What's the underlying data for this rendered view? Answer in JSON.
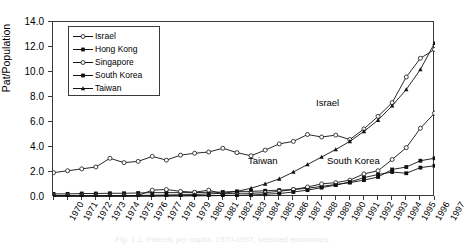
{
  "figure": {
    "caption": "Fig. 1.1. Patents per capita, 1970-1997, selected economies"
  },
  "axes": {
    "ylabel": "Pat/Population",
    "yticks": [
      "0.0",
      "2.0",
      "4.0",
      "6.0",
      "8.0",
      "10.0",
      "12.0",
      "14.0"
    ],
    "xticks": [
      "1970",
      "1971",
      "1972",
      "1973",
      "1974",
      "1975",
      "1976",
      "1977",
      "1978",
      "1979",
      "1980",
      "1981",
      "1982",
      "1983",
      "1984",
      "1985",
      "1986",
      "1987",
      "1988",
      "1989",
      "1990",
      "1991",
      "1992",
      "1993",
      "1994",
      "1995",
      "1996",
      "1997"
    ]
  },
  "legend": {
    "items": [
      {
        "label": "Israel",
        "marker": "open-circle",
        "color": "#111111"
      },
      {
        "label": "Hong Kong",
        "marker": "filled-square",
        "color": "#111111"
      },
      {
        "label": "Singapore",
        "marker": "open-circle",
        "color": "#111111"
      },
      {
        "label": "South Korea",
        "marker": "filled-square",
        "color": "#111111"
      },
      {
        "label": "Taiwan",
        "marker": "filled-triangle",
        "color": "#111111"
      }
    ]
  },
  "annotations": [
    {
      "text": "Israel",
      "x": 316,
      "y": 97
    },
    {
      "text": "Taiwan",
      "x": 248,
      "y": 155
    },
    {
      "text": "South Korea",
      "x": 327,
      "y": 155
    }
  ],
  "chart_data": {
    "type": "line",
    "title": "",
    "xlabel": "",
    "ylabel": "Pat/Population",
    "ylim": [
      0.0,
      14.0
    ],
    "ytick_step": 2.0,
    "grid": false,
    "legend_position": "upper-left",
    "x": [
      1970,
      1971,
      1972,
      1973,
      1974,
      1975,
      1976,
      1977,
      1978,
      1979,
      1980,
      1981,
      1982,
      1983,
      1984,
      1985,
      1986,
      1987,
      1988,
      1989,
      1990,
      1991,
      1992,
      1993,
      1994,
      1995,
      1996,
      1997
    ],
    "series": [
      {
        "name": "Israel",
        "marker": "open-circle",
        "values": [
          1.95,
          2.1,
          2.25,
          2.4,
          3.1,
          2.75,
          2.85,
          3.25,
          2.95,
          3.35,
          3.5,
          3.6,
          3.9,
          3.55,
          3.3,
          3.75,
          4.25,
          4.45,
          5.0,
          4.8,
          4.95,
          4.6,
          5.45,
          6.45,
          7.55,
          9.6,
          11.1,
          11.8
        ]
      },
      {
        "name": "Hong Kong",
        "marker": "filled-square",
        "values": [
          0.25,
          0.25,
          0.28,
          0.28,
          0.3,
          0.3,
          0.32,
          0.35,
          0.35,
          0.35,
          0.35,
          0.38,
          0.4,
          0.45,
          0.45,
          0.5,
          0.55,
          0.6,
          0.7,
          0.85,
          1.0,
          1.15,
          1.35,
          1.6,
          2.2,
          2.4,
          2.9,
          3.1
        ]
      },
      {
        "name": "Singapore",
        "marker": "open-circle",
        "values": [
          0.12,
          0.12,
          0.12,
          0.12,
          0.12,
          0.12,
          0.12,
          0.55,
          0.6,
          0.45,
          0.38,
          0.55,
          0.25,
          0.3,
          0.3,
          0.35,
          0.45,
          0.6,
          0.8,
          1.05,
          1.15,
          1.35,
          1.85,
          2.1,
          3.0,
          3.95,
          5.5,
          6.7
        ]
      },
      {
        "name": "South Korea",
        "marker": "filled-square",
        "values": [
          0.05,
          0.05,
          0.05,
          0.05,
          0.05,
          0.05,
          0.05,
          0.06,
          0.07,
          0.08,
          0.09,
          0.1,
          0.12,
          0.14,
          0.16,
          0.22,
          0.28,
          0.4,
          0.55,
          0.75,
          0.95,
          1.2,
          1.55,
          1.8,
          2.0,
          1.9,
          2.35,
          2.5
        ]
      },
      {
        "name": "Taiwan",
        "marker": "filled-triangle",
        "values": [
          0.1,
          0.1,
          0.1,
          0.1,
          0.1,
          0.1,
          0.12,
          0.14,
          0.16,
          0.18,
          0.2,
          0.25,
          0.3,
          0.45,
          0.7,
          1.05,
          1.45,
          2.0,
          2.6,
          3.2,
          3.8,
          4.45,
          5.25,
          6.15,
          7.3,
          8.6,
          10.2,
          12.3
        ]
      }
    ]
  }
}
